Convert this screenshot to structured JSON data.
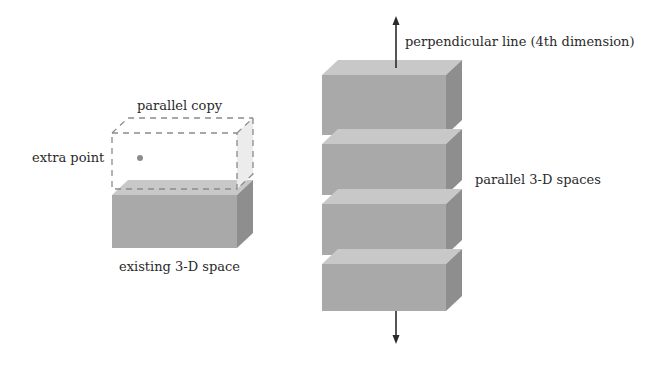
{
  "left_figure": {
    "title_label": "parallel copy",
    "point_label": "extra point",
    "base_label": "existing 3-D space"
  },
  "right_figure": {
    "arrow_label": "perpendicular line (4th dimension)",
    "stack_label": "parallel 3-D spaces",
    "block_count": 4
  },
  "colors": {
    "front_face": "#a9a9a9",
    "top_face": "#c8c8c8",
    "side_face": "#8e8e8e",
    "dashed_outline": "#8a8a8a",
    "point": "#8c8c8c",
    "arrow": "#2b2b2b",
    "text": "#2a2a2a"
  }
}
